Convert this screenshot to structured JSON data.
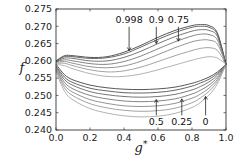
{
  "chart_data": {
    "type": "line",
    "title": "",
    "xlabel": "g*",
    "ylabel": "f",
    "xlim": [
      0.0,
      1.0
    ],
    "ylim": [
      0.24,
      0.275
    ],
    "xticks": [
      "0.0",
      "0.2",
      "0.4",
      "0.6",
      "0.8",
      "1.0"
    ],
    "yticks": [
      "0.240",
      "0.245",
      "0.250",
      "0.255",
      "0.260",
      "0.265",
      "0.270",
      "0.275"
    ],
    "grid": false,
    "legend": "none",
    "x": [
      0.0,
      0.05,
      0.1,
      0.2,
      0.3,
      0.4,
      0.5,
      0.6,
      0.7,
      0.8,
      0.85,
      0.9,
      0.95,
      1.0
    ],
    "series": [
      {
        "name": "upper 0.998",
        "branch": "upper",
        "values": [
          0.26,
          0.2615,
          0.2615,
          0.261,
          0.2612,
          0.2625,
          0.2645,
          0.2668,
          0.2688,
          0.2702,
          0.2705,
          0.2702,
          0.268,
          0.259
        ]
      },
      {
        "name": "upper 0.9",
        "branch": "upper",
        "values": [
          0.26,
          0.2612,
          0.2612,
          0.2607,
          0.2609,
          0.262,
          0.264,
          0.2662,
          0.2682,
          0.2697,
          0.27,
          0.2697,
          0.2676,
          0.259
        ]
      },
      {
        "name": "upper 0.75",
        "branch": "upper",
        "values": [
          0.2598,
          0.2608,
          0.2607,
          0.26,
          0.26,
          0.261,
          0.2628,
          0.265,
          0.267,
          0.2686,
          0.269,
          0.2688,
          0.267,
          0.259
        ]
      },
      {
        "name": "upper mid-a",
        "branch": "upper",
        "values": [
          0.2597,
          0.2603,
          0.26,
          0.2592,
          0.259,
          0.2598,
          0.2614,
          0.2635,
          0.2655,
          0.2672,
          0.2677,
          0.2676,
          0.266,
          0.259
        ]
      },
      {
        "name": "upper mid-b",
        "branch": "upper",
        "values": [
          0.2595,
          0.2598,
          0.2593,
          0.2583,
          0.258,
          0.2585,
          0.2599,
          0.2618,
          0.2638,
          0.2655,
          0.266,
          0.266,
          0.2648,
          0.259
        ]
      },
      {
        "name": "upper mid-c",
        "branch": "upper",
        "values": [
          0.2593,
          0.2593,
          0.2586,
          0.2574,
          0.2568,
          0.2571,
          0.2582,
          0.2598,
          0.2615,
          0.263,
          0.2636,
          0.2638,
          0.263,
          0.259
        ]
      },
      {
        "name": "upper 0",
        "branch": "upper",
        "values": [
          0.259,
          0.2586,
          0.2577,
          0.2563,
          0.2555,
          0.2555,
          0.2562,
          0.2574,
          0.2588,
          0.2602,
          0.2608,
          0.2612,
          0.2608,
          0.259
        ]
      },
      {
        "name": "lower 0.998",
        "branch": "lower",
        "values": [
          0.259,
          0.256,
          0.2545,
          0.253,
          0.2522,
          0.2518,
          0.2517,
          0.2519,
          0.2524,
          0.2535,
          0.2543,
          0.2553,
          0.2568,
          0.259
        ]
      },
      {
        "name": "lower 0.9",
        "branch": "lower",
        "values": [
          0.2585,
          0.2553,
          0.2537,
          0.2521,
          0.2513,
          0.2508,
          0.2507,
          0.2509,
          0.2515,
          0.2527,
          0.2536,
          0.2547,
          0.2564,
          0.259
        ]
      },
      {
        "name": "lower 0.75",
        "branch": "lower",
        "values": [
          0.2582,
          0.2546,
          0.2529,
          0.2511,
          0.2502,
          0.2497,
          0.2495,
          0.2497,
          0.2503,
          0.2516,
          0.2526,
          0.2539,
          0.2559,
          0.259
        ]
      },
      {
        "name": "lower 0.5",
        "branch": "lower",
        "values": [
          0.2578,
          0.2538,
          0.2519,
          0.25,
          0.249,
          0.2484,
          0.2482,
          0.2484,
          0.249,
          0.2504,
          0.2515,
          0.253,
          0.2553,
          0.259
        ]
      },
      {
        "name": "lower mid",
        "branch": "lower",
        "values": [
          0.2575,
          0.253,
          0.2509,
          0.2488,
          0.2477,
          0.247,
          0.2468,
          0.247,
          0.2477,
          0.2492,
          0.2504,
          0.2521,
          0.2547,
          0.259
        ]
      },
      {
        "name": "lower 0.25",
        "branch": "lower",
        "values": [
          0.2572,
          0.2522,
          0.2499,
          0.2476,
          0.2464,
          0.2457,
          0.2454,
          0.2456,
          0.2463,
          0.2479,
          0.2493,
          0.2512,
          0.2541,
          0.259
        ]
      },
      {
        "name": "lower 0",
        "branch": "lower",
        "values": [
          0.2568,
          0.2512,
          0.2487,
          0.2462,
          0.2449,
          0.2441,
          0.2438,
          0.244,
          0.2448,
          0.2465,
          0.248,
          0.2501,
          0.2534,
          0.259
        ]
      }
    ],
    "annotations": [
      {
        "text": "0.998",
        "x": 0.43,
        "y_text": 0.271,
        "arrow_to": [
          0.43,
          0.263
        ]
      },
      {
        "text": "0.9",
        "x": 0.59,
        "y_text": 0.271,
        "arrow_to": [
          0.59,
          0.265
        ]
      },
      {
        "text": "0.75",
        "x": 0.72,
        "y_text": 0.271,
        "arrow_to": [
          0.72,
          0.2657
        ]
      },
      {
        "text": "0.5",
        "x": 0.59,
        "y_text": 0.2425,
        "arrow_to": [
          0.59,
          0.2488
        ]
      },
      {
        "text": "0.25",
        "x": 0.74,
        "y_text": 0.2425,
        "arrow_to": [
          0.74,
          0.249
        ]
      },
      {
        "text": "0",
        "x": 0.88,
        "y_text": 0.2425,
        "arrow_to": [
          0.88,
          0.2497
        ]
      }
    ]
  }
}
